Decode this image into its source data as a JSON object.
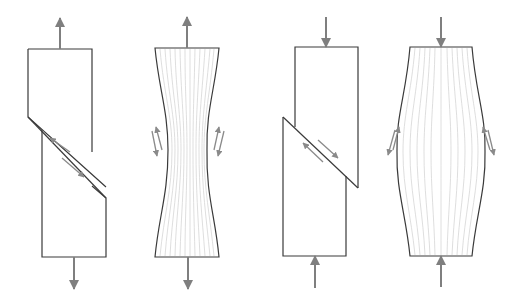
{
  "diagram": {
    "type": "material deformation under axial load",
    "colors": {
      "outline": "#3a3a3a",
      "force_arrow": "#7f7f7f",
      "shear_arrow": "#8a8a8a",
      "grain_lines": "#d6d6d6",
      "background": "#ffffff"
    },
    "panels": [
      {
        "id": "tension-shear-fracture",
        "load": "tension",
        "failure": "shear slip along inclined plane",
        "force_arrows": [
          "up (top)",
          "down (bottom)"
        ],
        "shear_arrow_pairs": 1
      },
      {
        "id": "tension-necking",
        "load": "tension",
        "failure": "ductile necking with flow lines",
        "force_arrows": [
          "up (top)",
          "down (bottom)"
        ],
        "shear_arrow_pairs": 2
      },
      {
        "id": "compression-shear-fracture",
        "load": "compression",
        "failure": "shear slip along inclined plane",
        "force_arrows": [
          "down (top)",
          "up (bottom)"
        ],
        "shear_arrow_pairs": 1
      },
      {
        "id": "compression-barreling",
        "load": "compression",
        "failure": "ductile barreling with flow lines",
        "force_arrows": [
          "down (top)",
          "up (bottom)"
        ],
        "shear_arrow_pairs": 2
      }
    ]
  }
}
